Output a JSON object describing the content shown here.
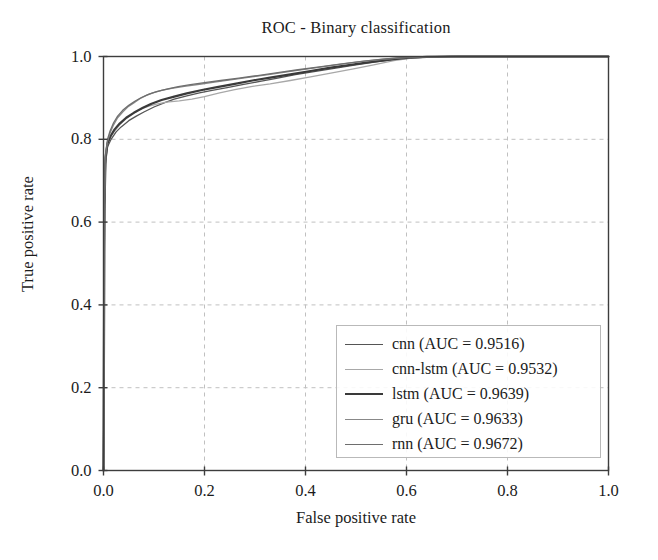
{
  "chart_data": {
    "type": "line",
    "title": "ROC - Binary classification",
    "xlabel": "False positive rate",
    "ylabel": "True positive rate",
    "xlim": [
      0.0,
      1.0
    ],
    "ylim": [
      0.0,
      1.0
    ],
    "xticks": [
      "0.0",
      "0.2",
      "0.4",
      "0.6",
      "0.8",
      "1.0"
    ],
    "yticks": [
      "0.0",
      "0.2",
      "0.4",
      "0.6",
      "0.8",
      "1.0"
    ],
    "xtick_values": [
      0.0,
      0.2,
      0.4,
      0.6,
      0.8,
      1.0
    ],
    "ytick_values": [
      0.0,
      0.2,
      0.4,
      0.6,
      0.8,
      1.0
    ],
    "grid": true,
    "grid_style": "dashed",
    "legend_position": "lower right",
    "series": [
      {
        "name": "cnn",
        "auc": 0.9516,
        "legend_label": "cnn (AUC = 0.9516)",
        "color": "#555555",
        "width": 1.3,
        "points": [
          [
            0.0,
            0.0
          ],
          [
            0.002,
            0.62
          ],
          [
            0.004,
            0.74
          ],
          [
            0.008,
            0.782
          ],
          [
            0.015,
            0.8
          ],
          [
            0.025,
            0.818
          ],
          [
            0.035,
            0.83
          ],
          [
            0.05,
            0.845
          ],
          [
            0.065,
            0.856
          ],
          [
            0.08,
            0.866
          ],
          [
            0.1,
            0.878
          ],
          [
            0.12,
            0.888
          ],
          [
            0.14,
            0.897
          ],
          [
            0.165,
            0.905
          ],
          [
            0.19,
            0.912
          ],
          [
            0.215,
            0.918
          ],
          [
            0.245,
            0.925
          ],
          [
            0.275,
            0.932
          ],
          [
            0.31,
            0.94
          ],
          [
            0.345,
            0.948
          ],
          [
            0.38,
            0.956
          ],
          [
            0.42,
            0.964
          ],
          [
            0.46,
            0.972
          ],
          [
            0.5,
            0.98
          ],
          [
            0.54,
            0.987
          ],
          [
            0.58,
            0.993
          ],
          [
            0.615,
            0.997
          ],
          [
            0.65,
            0.999
          ],
          [
            0.7,
            1.0
          ],
          [
            1.0,
            1.0
          ]
        ]
      },
      {
        "name": "cnn-lstm",
        "auc": 0.9532,
        "legend_label": "cnn-lstm (AUC = 0.9532)",
        "color": "#a8a8a8",
        "width": 1.3,
        "points": [
          [
            0.0,
            0.0
          ],
          [
            0.002,
            0.63
          ],
          [
            0.004,
            0.75
          ],
          [
            0.008,
            0.788
          ],
          [
            0.014,
            0.805
          ],
          [
            0.022,
            0.82
          ],
          [
            0.032,
            0.835
          ],
          [
            0.045,
            0.85
          ],
          [
            0.058,
            0.862
          ],
          [
            0.072,
            0.872
          ],
          [
            0.09,
            0.88
          ],
          [
            0.105,
            0.885
          ],
          [
            0.125,
            0.89
          ],
          [
            0.15,
            0.893
          ],
          [
            0.175,
            0.897
          ],
          [
            0.2,
            0.903
          ],
          [
            0.23,
            0.912
          ],
          [
            0.26,
            0.92
          ],
          [
            0.295,
            0.928
          ],
          [
            0.33,
            0.934
          ],
          [
            0.37,
            0.942
          ],
          [
            0.41,
            0.951
          ],
          [
            0.45,
            0.96
          ],
          [
            0.495,
            0.97
          ],
          [
            0.535,
            0.98
          ],
          [
            0.575,
            0.99
          ],
          [
            0.61,
            0.996
          ],
          [
            0.645,
            0.999
          ],
          [
            0.7,
            1.0
          ],
          [
            1.0,
            1.0
          ]
        ]
      },
      {
        "name": "lstm",
        "auc": 0.9639,
        "legend_label": "lstm (AUC = 0.9639)",
        "color": "#3a3a3a",
        "width": 2.2,
        "points": [
          [
            0.0,
            0.0
          ],
          [
            0.002,
            0.64
          ],
          [
            0.004,
            0.755
          ],
          [
            0.008,
            0.79
          ],
          [
            0.014,
            0.808
          ],
          [
            0.022,
            0.824
          ],
          [
            0.032,
            0.838
          ],
          [
            0.045,
            0.852
          ],
          [
            0.06,
            0.864
          ],
          [
            0.078,
            0.876
          ],
          [
            0.095,
            0.886
          ],
          [
            0.115,
            0.895
          ],
          [
            0.14,
            0.903
          ],
          [
            0.165,
            0.911
          ],
          [
            0.195,
            0.919
          ],
          [
            0.225,
            0.926
          ],
          [
            0.26,
            0.934
          ],
          [
            0.295,
            0.942
          ],
          [
            0.33,
            0.949
          ],
          [
            0.37,
            0.957
          ],
          [
            0.41,
            0.965
          ],
          [
            0.45,
            0.973
          ],
          [
            0.49,
            0.98
          ],
          [
            0.53,
            0.987
          ],
          [
            0.57,
            0.993
          ],
          [
            0.605,
            0.997
          ],
          [
            0.64,
            0.999
          ],
          [
            0.69,
            1.0
          ],
          [
            1.0,
            1.0
          ]
        ]
      },
      {
        "name": "gru",
        "auc": 0.9633,
        "legend_label": "gru (AUC = 0.9633)",
        "color": "#888888",
        "width": 1.3,
        "points": [
          [
            0.0,
            0.0
          ],
          [
            0.002,
            0.65
          ],
          [
            0.004,
            0.76
          ],
          [
            0.008,
            0.795
          ],
          [
            0.013,
            0.815
          ],
          [
            0.02,
            0.835
          ],
          [
            0.028,
            0.852
          ],
          [
            0.038,
            0.866
          ],
          [
            0.048,
            0.878
          ],
          [
            0.06,
            0.888
          ],
          [
            0.072,
            0.898
          ],
          [
            0.085,
            0.906
          ],
          [
            0.098,
            0.912
          ],
          [
            0.115,
            0.918
          ],
          [
            0.135,
            0.923
          ],
          [
            0.16,
            0.928
          ],
          [
            0.19,
            0.933
          ],
          [
            0.22,
            0.938
          ],
          [
            0.255,
            0.944
          ],
          [
            0.29,
            0.95
          ],
          [
            0.33,
            0.957
          ],
          [
            0.37,
            0.964
          ],
          [
            0.415,
            0.972
          ],
          [
            0.46,
            0.98
          ],
          [
            0.505,
            0.987
          ],
          [
            0.55,
            0.993
          ],
          [
            0.59,
            0.997
          ],
          [
            0.63,
            0.999
          ],
          [
            0.68,
            1.0
          ],
          [
            1.0,
            1.0
          ]
        ]
      },
      {
        "name": "rnn",
        "auc": 0.9672,
        "legend_label": "rnn (AUC = 0.9672)",
        "color": "#6e6e6e",
        "width": 1.3,
        "points": [
          [
            0.0,
            0.0
          ],
          [
            0.002,
            0.655
          ],
          [
            0.004,
            0.765
          ],
          [
            0.008,
            0.8
          ],
          [
            0.013,
            0.82
          ],
          [
            0.02,
            0.84
          ],
          [
            0.028,
            0.856
          ],
          [
            0.038,
            0.87
          ],
          [
            0.05,
            0.882
          ],
          [
            0.062,
            0.892
          ],
          [
            0.075,
            0.901
          ],
          [
            0.09,
            0.909
          ],
          [
            0.105,
            0.915
          ],
          [
            0.125,
            0.921
          ],
          [
            0.148,
            0.927
          ],
          [
            0.172,
            0.932
          ],
          [
            0.2,
            0.937
          ],
          [
            0.232,
            0.942
          ],
          [
            0.268,
            0.948
          ],
          [
            0.305,
            0.954
          ],
          [
            0.345,
            0.961
          ],
          [
            0.385,
            0.968
          ],
          [
            0.428,
            0.975
          ],
          [
            0.472,
            0.982
          ],
          [
            0.515,
            0.989
          ],
          [
            0.558,
            0.994
          ],
          [
            0.598,
            0.998
          ],
          [
            0.635,
            0.999
          ],
          [
            0.685,
            1.0
          ],
          [
            1.0,
            1.0
          ]
        ]
      }
    ]
  },
  "plot": {
    "axis_color": "#3d3d3d",
    "grid_color": "#c0c0c0",
    "background": "#ffffff"
  }
}
